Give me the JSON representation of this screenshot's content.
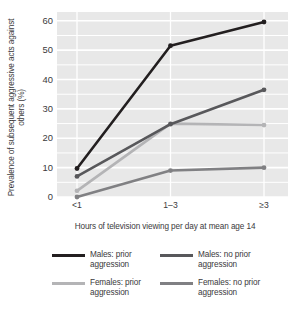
{
  "chart_data": {
    "type": "line",
    "title": "",
    "subtitle": "",
    "xlabel": "Hours of television viewing per day at mean age 14",
    "ylabel": "Prevalence of subsequent aggressive acts against others (%)",
    "categories": [
      "<1",
      "1–3",
      "≥3"
    ],
    "ylim": [
      0,
      63
    ],
    "yticks": [
      0,
      10,
      20,
      30,
      40,
      50,
      60
    ],
    "ytick_labels": [
      "0",
      "10",
      "20",
      "30",
      "40",
      "50",
      "60"
    ],
    "grid": "horizontal",
    "legend_position": "bottom",
    "series": [
      {
        "name": "Males: prior aggression",
        "legend_label": "Males: prior\naggression",
        "color": "#231f20",
        "values": [
          9.7,
          51.5,
          59.6
        ]
      },
      {
        "name": "Males: no prior aggression",
        "legend_label": "Males: no prior\naggression",
        "color": "#58585b",
        "values": [
          7.0,
          24.8,
          36.5
        ]
      },
      {
        "name": "Females: prior aggression",
        "legend_label": "Females: prior\naggression",
        "color": "#b4b4b6",
        "values": [
          2.1,
          25.0,
          24.5
        ]
      },
      {
        "name": "Females: no prior aggression",
        "legend_label": "Females: no prior\naggression",
        "color": "#808083",
        "values": [
          0.0,
          9.0,
          10.0
        ]
      }
    ]
  },
  "plot_background_color": "#e8e8e8",
  "gridline_color": "#ffffff"
}
